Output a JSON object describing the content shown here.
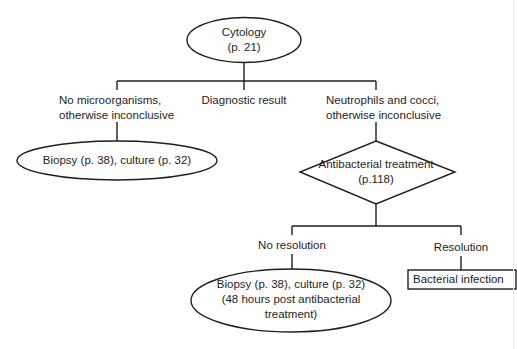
{
  "diagram": {
    "root": {
      "line1": "Cytology",
      "line2": "(p. 21)"
    },
    "branches": {
      "left": {
        "line1": "No microorganisms,",
        "line2": "otherwise inconclusive"
      },
      "middle": {
        "label": "Diagnostic result"
      },
      "right": {
        "line1": "Neutrophils and cocci,",
        "line2": "otherwise inconclusive"
      }
    },
    "left_result": {
      "label": "Biopsy (p. 38), culture (p. 32)"
    },
    "decision": {
      "line1": "Antibacterial treatment",
      "line2": "(p.118)"
    },
    "outcomes": {
      "no_resolution": {
        "label": "No resolution"
      },
      "resolution": {
        "label": "Resolution"
      }
    },
    "no_resolution_result": {
      "line1": "Biopsy (p. 38), culture (p. 32)",
      "line2": "(48 hours post antibacterial",
      "line3": "treatment)"
    },
    "resolution_result": {
      "label": "Bacterial infection"
    },
    "colors": {
      "stroke": "#1e1e1e",
      "background": "#ffffff"
    }
  }
}
